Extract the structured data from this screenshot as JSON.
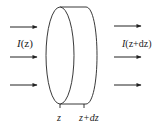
{
  "diagram": {
    "type": "slab-intensity-diagram",
    "incoming_label": {
      "symbol": "I",
      "arg": "(z)"
    },
    "outgoing_label": {
      "symbol": "I",
      "arg": "(z+dz)"
    },
    "position_labels": {
      "front": "z",
      "back": "z+dz"
    },
    "incoming_arrows": 3,
    "outgoing_arrows": 3,
    "colors": {
      "stroke": "#222222",
      "background": "#ffffff"
    }
  }
}
